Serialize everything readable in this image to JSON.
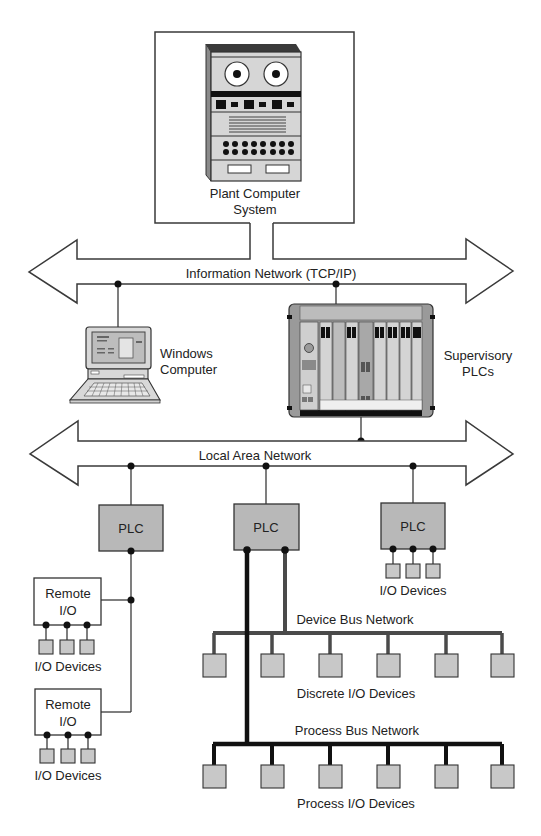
{
  "diagram": {
    "type": "industrial network hierarchy",
    "colors": {
      "line": "#3a3a3a",
      "device_fill": "#c8c8c8",
      "plc_fill": "#b8b8b8",
      "process_bus": "#111111",
      "device_bus": "#4a4a4a"
    },
    "plant_computer": {
      "label_line1": "Plant Computer",
      "label_line2": "System"
    },
    "information_network": {
      "label": "Information Network (TCP/IP)"
    },
    "windows_computer": {
      "label_line1": "Windows",
      "label_line2": "Computer"
    },
    "supervisory_plcs": {
      "label_line1": "Supervisory",
      "label_line2": "PLCs"
    },
    "local_area_network": {
      "label": "Local Area Network"
    },
    "plcs": [
      {
        "label": "PLC"
      },
      {
        "label": "PLC"
      },
      {
        "label": "PLC"
      }
    ],
    "plc_right_devices": {
      "label": "I/O Devices",
      "count": 3
    },
    "remote_io": [
      {
        "label_line1": "Remote",
        "label_line2": "I/O",
        "devices_label": "I/O Devices",
        "device_count": 3
      },
      {
        "label_line1": "Remote",
        "label_line2": "I/O",
        "devices_label": "I/O Devices",
        "device_count": 3
      }
    ],
    "device_bus": {
      "label": "Device Bus Network",
      "devices_label": "Discrete I/O Devices",
      "device_count": 6
    },
    "process_bus": {
      "label": "Process Bus Network",
      "devices_label": "Process I/O Devices",
      "device_count": 6
    }
  }
}
